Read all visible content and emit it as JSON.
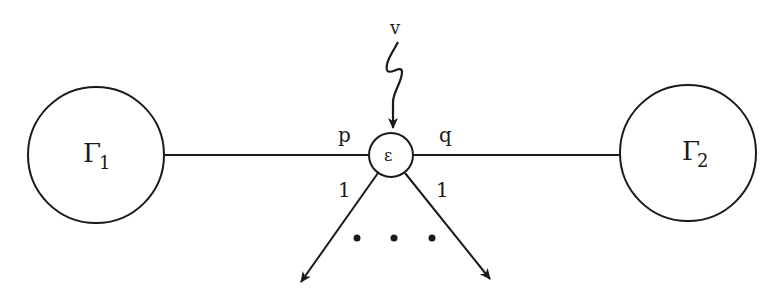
{
  "diagram": {
    "nodes": {
      "left": {
        "label": "Γ",
        "subscript": "1"
      },
      "center": {
        "label": "ε"
      },
      "right": {
        "label": "Γ",
        "subscript": "2"
      }
    },
    "edges": {
      "left_edge_label": "p",
      "right_edge_label": "q",
      "lower_left_label": "1",
      "lower_right_label": "1",
      "incoming_label": "v",
      "ellipsis": "• • •"
    }
  },
  "colors": {
    "stroke": "#1a1a1a",
    "background": "#ffffff"
  }
}
